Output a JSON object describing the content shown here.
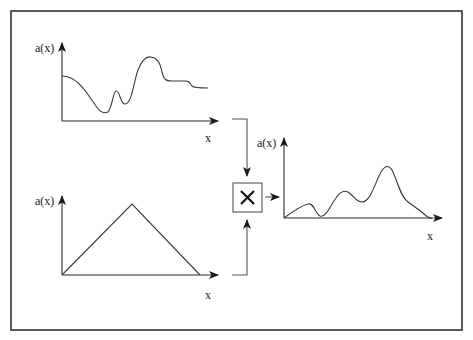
{
  "diagram": {
    "title": "",
    "frame": {
      "x": 11,
      "y": 11,
      "width": 451,
      "height": 319,
      "border_color": "#333333"
    },
    "plots": [
      {
        "id": "signal",
        "y_label": "a(x)",
        "x_label": "x",
        "description": "arbitrary smooth signal with dips and a large peak"
      },
      {
        "id": "window",
        "y_label": "a(x)",
        "x_label": "x",
        "description": "triangular window function"
      },
      {
        "id": "product",
        "y_label": "a(x)",
        "x_label": "x",
        "description": "windowed signal (product), tapering to zero at both ends"
      }
    ],
    "operator": {
      "symbol": "✕",
      "name": "multiply"
    },
    "edges": [
      {
        "from": "signal",
        "to": "multiply"
      },
      {
        "from": "window",
        "to": "multiply"
      },
      {
        "from": "multiply",
        "to": "product"
      }
    ]
  }
}
